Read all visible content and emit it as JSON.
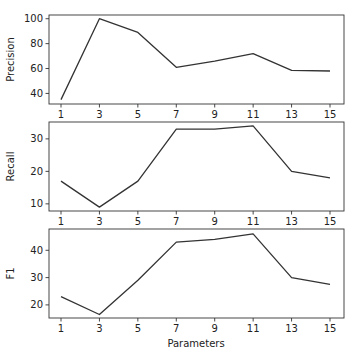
{
  "chart_data": [
    {
      "type": "line",
      "title": "",
      "xlabel": "",
      "ylabel": "Precision",
      "x": [
        1,
        3,
        5,
        7,
        9,
        11,
        13,
        15
      ],
      "x_ticks": [
        "1",
        "3",
        "5",
        "7",
        "9",
        "11",
        "13",
        "15"
      ],
      "y_ticks": [
        40,
        60,
        80,
        100
      ],
      "ylim": [
        31.5,
        103
      ],
      "values": [
        35,
        100,
        89,
        61,
        66,
        72,
        58.5,
        58
      ],
      "grid": false,
      "color": "#333333"
    },
    {
      "type": "line",
      "title": "",
      "xlabel": "",
      "ylabel": "Recall",
      "x": [
        1,
        3,
        5,
        7,
        9,
        11,
        13,
        15
      ],
      "x_ticks": [
        "1",
        "3",
        "5",
        "7",
        "9",
        "11",
        "13",
        "15"
      ],
      "y_ticks": [
        10,
        20,
        30
      ],
      "ylim": [
        7.8,
        35.2
      ],
      "values": [
        17,
        9,
        17,
        33,
        33,
        34,
        20,
        18
      ],
      "grid": false,
      "color": "#333333"
    },
    {
      "type": "line",
      "title": "",
      "xlabel": "Parameters",
      "ylabel": "F1",
      "x": [
        1,
        3,
        5,
        7,
        9,
        11,
        13,
        15
      ],
      "x_ticks": [
        "1",
        "3",
        "5",
        "7",
        "9",
        "11",
        "13",
        "15"
      ],
      "y_ticks": [
        20,
        30,
        40
      ],
      "ylim": [
        15.2,
        47.8
      ],
      "values": [
        23,
        16.5,
        29,
        43,
        44,
        46,
        30,
        27.5
      ],
      "grid": false,
      "color": "#333333"
    }
  ]
}
